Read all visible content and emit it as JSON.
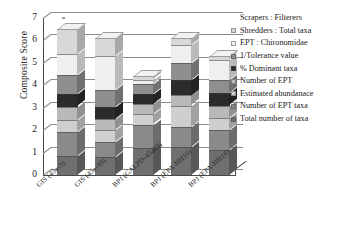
{
  "chart_data": {
    "type": "bar",
    "subtype": "stacked-column-3d",
    "title": "",
    "xlabel": "",
    "ylabel": "Composite Score",
    "ylim": [
      0,
      7
    ],
    "yticks": [
      0,
      1,
      2,
      3,
      4,
      5,
      6,
      7
    ],
    "grid": true,
    "legend_position": "right",
    "categories": [
      "GIS (45a-3)",
      "GIS (45a-89)",
      "BPJ (GALPD-45a03)",
      "BPJ (EPA-HH16)",
      "BPJ (EPA-HH18)"
    ],
    "series": [
      {
        "name": "Total number of taxa",
        "values": [
          0.85,
          0.8,
          1.2,
          1.25,
          1.1
        ]
      },
      {
        "name": "Number of EPT taxa",
        "values": [
          1.05,
          0.65,
          1.05,
          0.9,
          0.9
        ]
      },
      {
        "name": "Estimated abundanace",
        "values": [
          0.55,
          0.55,
          0.45,
          0.95,
          0.55
        ]
      },
      {
        "name": "Number of EPT",
        "values": [
          0.6,
          0.5,
          0.45,
          0.45,
          0.55
        ]
      },
      {
        "name": "% Dominant taxa",
        "values": [
          0.55,
          0.55,
          0.45,
          0.7,
          0.55
        ]
      },
      {
        "name": "1/Tolerance value",
        "values": [
          0.85,
          0.75,
          0.45,
          0.75,
          0.6
        ]
      },
      {
        "name": "EPT : Chironomidae",
        "values": [
          0.95,
          1.5,
          0.2,
          0.8,
          0.9
        ]
      },
      {
        "name": "Shredders : Total taxa",
        "values": [
          1.1,
          0.8,
          0.15,
          0.3,
          0.15
        ]
      },
      {
        "name": "Scrapers : Filterers",
        "values": [
          0.0,
          0.0,
          0.0,
          0.0,
          0.0
        ]
      }
    ],
    "totals": [
      6.5,
      6.1,
      4.4,
      6.1,
      5.3
    ]
  },
  "legend": {
    "entries": [
      {
        "label": "Scrapers : Filterers",
        "color": "#ffffff"
      },
      {
        "label": "Shredders : Total taxa",
        "color": "#d8d8d8"
      },
      {
        "label": "EPT : Chironomidae",
        "color": "#efefef"
      },
      {
        "label": "1/Tolerance value",
        "color": "#8f8f8f"
      },
      {
        "label": "% Dominant taxa",
        "color": "#2b2b2b"
      },
      {
        "label": "Number of EPT",
        "color": "#b9b9b9"
      },
      {
        "label": "Estimated abundanace",
        "color": "#cfcfcf"
      },
      {
        "label": "Number of EPT taxa",
        "color": "#8a8a8a"
      },
      {
        "label": "Total number of taxa",
        "color": "#6f6f6f"
      }
    ]
  },
  "axis": {
    "y_title": "Composite Score",
    "y_tick_labels": [
      "7",
      "6",
      "5",
      "4",
      "3",
      "2",
      "1",
      "0"
    ]
  },
  "colors": {
    "axis": "#4a4a4a",
    "grid": "#8d8d8d",
    "background": "#ffffff",
    "text": "#1a1a1a"
  }
}
